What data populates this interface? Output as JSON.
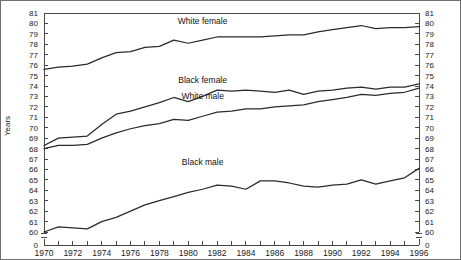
{
  "figure": {
    "background_color": "#ffffff",
    "frame_color": "#6f6f6f",
    "line_color": "#2b2b2b"
  },
  "axes": {
    "y_axis_label": "Years",
    "y_ticks": [
      "60",
      "61",
      "62",
      "63",
      "64",
      "65",
      "66",
      "67",
      "68",
      "69",
      "70",
      "71",
      "72",
      "73",
      "74",
      "75",
      "76",
      "77",
      "78",
      "79",
      "80",
      "81"
    ],
    "y_zero_tick": "0",
    "x_ticks_labeled": [
      "1970",
      "1972",
      "1974",
      "1976",
      "1978",
      "1980",
      "1982",
      "1984",
      "1986",
      "1988",
      "1990",
      "1992",
      "1994",
      "1996"
    ]
  },
  "series_labels": {
    "white_female": "White female",
    "black_female": "Black female",
    "white_male": "White male",
    "black_male": "Black male"
  },
  "chart_data": {
    "type": "line",
    "title": "",
    "subtitle": "",
    "xlabel": "",
    "ylabel": "Years",
    "xlim": [
      1970,
      1996
    ],
    "ylim": [
      60,
      81
    ],
    "y_axis_break": true,
    "y_break_note": "Axis broken between 0 and 60",
    "grid": false,
    "legend_position": "inline-labels",
    "x": [
      1970,
      1971,
      1972,
      1973,
      1974,
      1975,
      1976,
      1977,
      1978,
      1979,
      1980,
      1981,
      1982,
      1983,
      1984,
      1985,
      1986,
      1987,
      1988,
      1989,
      1990,
      1991,
      1992,
      1993,
      1994,
      1995,
      1996
    ],
    "series": [
      {
        "name": "White female",
        "label_x": 1981.0,
        "label_y": 79.9,
        "values": [
          75.6,
          75.8,
          75.9,
          76.1,
          76.7,
          77.2,
          77.3,
          77.7,
          77.8,
          78.4,
          78.1,
          78.4,
          78.7,
          78.7,
          78.7,
          78.7,
          78.8,
          78.9,
          78.9,
          79.2,
          79.4,
          79.6,
          79.8,
          79.5,
          79.6,
          79.6,
          79.7
        ]
      },
      {
        "name": "Black female",
        "label_x": 1981.0,
        "label_y": 74.3,
        "values": [
          68.3,
          69.0,
          69.1,
          69.2,
          70.3,
          71.3,
          71.6,
          72.0,
          72.4,
          72.9,
          72.5,
          73.0,
          73.6,
          73.5,
          73.6,
          73.5,
          73.4,
          73.6,
          73.2,
          73.5,
          73.6,
          73.8,
          73.9,
          73.7,
          73.9,
          73.9,
          74.2
        ]
      },
      {
        "name": "White male",
        "label_x": 1981.0,
        "label_y": 72.8,
        "values": [
          68.0,
          68.3,
          68.3,
          68.4,
          69.0,
          69.5,
          69.9,
          70.2,
          70.4,
          70.8,
          70.7,
          71.1,
          71.5,
          71.6,
          71.8,
          71.8,
          72.0,
          72.1,
          72.2,
          72.5,
          72.7,
          72.9,
          73.2,
          73.1,
          73.3,
          73.4,
          73.8
        ]
      },
      {
        "name": "Black male",
        "label_x": 1981.0,
        "label_y": 66.4,
        "values": [
          60.0,
          60.5,
          60.4,
          60.3,
          61.0,
          61.4,
          62.0,
          62.6,
          63.0,
          63.4,
          63.8,
          64.1,
          64.5,
          64.4,
          64.1,
          64.9,
          64.9,
          64.7,
          64.4,
          64.3,
          64.5,
          64.6,
          65.0,
          64.6,
          64.9,
          65.2,
          66.1
        ]
      }
    ]
  }
}
